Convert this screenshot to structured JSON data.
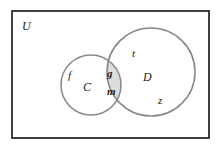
{
  "diagram": {
    "type": "venn",
    "universe": {
      "label": "U",
      "x": 12,
      "y": 11,
      "width": 197,
      "height": 127,
      "border_color": "#111111"
    },
    "sets": [
      {
        "label": "C",
        "cx": 91,
        "cy": 85,
        "r": 30,
        "stroke": "#8a8a8a"
      },
      {
        "label": "D",
        "cx": 151,
        "cy": 72,
        "r": 44,
        "stroke": "#8a8a8a"
      }
    ],
    "shaded_region": {
      "description": "C ∩ D",
      "fill": "#dcdcdc"
    },
    "elements": {
      "only_C": [
        "f"
      ],
      "C_and_D": [
        "g",
        "m"
      ],
      "only_D": [
        "t",
        "z"
      ]
    },
    "labels": {
      "U": "U",
      "C": "C",
      "D": "D",
      "f": "f",
      "g": "g",
      "m": "m",
      "t": "t",
      "z": "z"
    }
  }
}
